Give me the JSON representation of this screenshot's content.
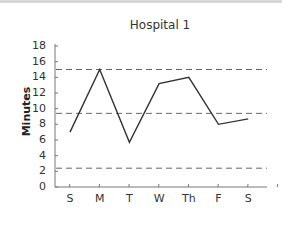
{
  "chart_data": {
    "type": "line",
    "title": "Hospital 1",
    "xlabel": "",
    "ylabel": "Minutes",
    "categories": [
      "S",
      "M",
      "T",
      "W",
      "Th",
      "F",
      "S"
    ],
    "series": [
      {
        "name": "Hospital 1",
        "values": [
          7,
          15,
          5.7,
          13.2,
          14,
          8,
          8.7
        ]
      }
    ],
    "reference_lines": [
      {
        "name": "upper-control-limit",
        "value": 15,
        "style": "dashed"
      },
      {
        "name": "mean",
        "value": 9.4,
        "style": "dashed"
      },
      {
        "name": "lower-control-limit",
        "value": 2.4,
        "style": "dashed"
      }
    ],
    "ylim": [
      0,
      18
    ],
    "yticks": [
      0,
      2,
      4,
      6,
      8,
      10,
      12,
      14,
      16,
      18
    ],
    "grid": false,
    "legend": "none"
  },
  "labels": {
    "title": "Hospital 1",
    "ylabel": "Minutes",
    "yticks": [
      "0",
      "2",
      "4",
      "6",
      "8",
      "10",
      "12",
      "14",
      "16",
      "18"
    ],
    "xticks": [
      "S",
      "M",
      "T",
      "W",
      "Th",
      "F",
      "S"
    ]
  },
  "colors": {
    "line": "#333333",
    "reference": "#666666",
    "axis": "#777777"
  }
}
